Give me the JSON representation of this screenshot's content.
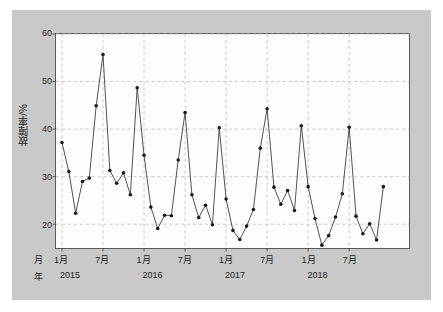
{
  "chart_data": {
    "type": "line",
    "title": "",
    "xlabel": "",
    "ylabel": "故障率/%",
    "ylim": [
      15,
      60
    ],
    "yticks": [
      20,
      30,
      40,
      50,
      60
    ],
    "ytick_labels": [
      "20",
      "30",
      "40",
      "50",
      "60"
    ],
    "grid": true,
    "legend": false,
    "axis_row_labels": {
      "month_row": "月",
      "year_row": "年"
    },
    "x_major_ticks": [
      {
        "month": "1月",
        "year": "2015",
        "index": 0
      },
      {
        "month": "7月",
        "year": "",
        "index": 6
      },
      {
        "month": "1月",
        "year": "2016",
        "index": 12
      },
      {
        "month": "7月",
        "year": "",
        "index": 18
      },
      {
        "month": "1月",
        "year": "2017",
        "index": 24
      },
      {
        "month": "7月",
        "year": "",
        "index": 30
      },
      {
        "month": "1月",
        "year": "2018",
        "index": 36
      },
      {
        "month": "7月",
        "year": "",
        "index": 42
      }
    ],
    "x": [
      "2015-01",
      "2015-02",
      "2015-03",
      "2015-04",
      "2015-05",
      "2015-06",
      "2015-07",
      "2015-08",
      "2015-09",
      "2015-10",
      "2015-11",
      "2015-12",
      "2016-01",
      "2016-02",
      "2016-03",
      "2016-04",
      "2016-05",
      "2016-06",
      "2016-07",
      "2016-08",
      "2016-09",
      "2016-10",
      "2016-11",
      "2016-12",
      "2017-01",
      "2017-02",
      "2017-03",
      "2017-04",
      "2017-05",
      "2017-06",
      "2017-07",
      "2017-08",
      "2017-09",
      "2017-10",
      "2017-11",
      "2017-12",
      "2018-01",
      "2018-02",
      "2018-03",
      "2018-04",
      "2018-05",
      "2018-06",
      "2018-07",
      "2018-08",
      "2018-09",
      "2018-10",
      "2018-11"
    ],
    "values": [
      37.2,
      31.1,
      22.3,
      29.0,
      29.7,
      44.9,
      55.7,
      31.3,
      28.6,
      30.8,
      26.2,
      48.7,
      34.5,
      23.6,
      19.1,
      21.9,
      21.8,
      33.5,
      43.5,
      26.2,
      21.4,
      24.0,
      19.9,
      40.3,
      25.3,
      18.7,
      16.8,
      19.6,
      23.1,
      36.0,
      44.3,
      27.8,
      24.2,
      27.1,
      22.9,
      40.7,
      27.9,
      21.2,
      15.6,
      17.6,
      21.5,
      26.4,
      40.4,
      21.7,
      18.0,
      20.1,
      16.7
    ],
    "values_tail": [
      27.9
    ],
    "series": [
      {
        "name": "故障率",
        "marker": "circle",
        "line_color": "#3d3d3d",
        "marker_color": "#1a1a1a"
      }
    ],
    "colors": {
      "figure_background": "#ffffff",
      "panel_background": "#c9c9c9",
      "plot_background": "#fdfdfd",
      "grid": "#b9b9c6",
      "axis": "#5a5a5a",
      "text": "#1d1d1d"
    }
  }
}
